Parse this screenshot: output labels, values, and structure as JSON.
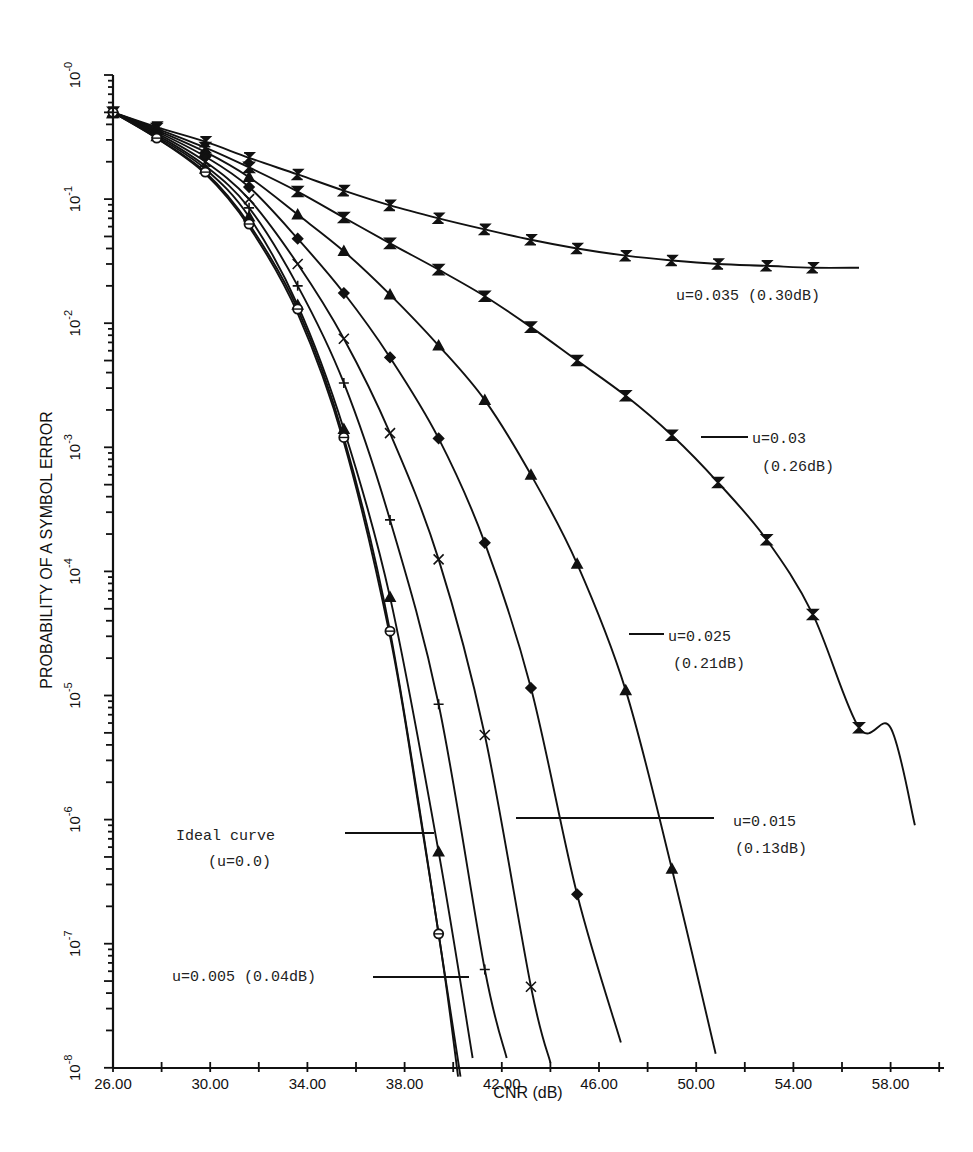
{
  "chart_data": {
    "type": "line",
    "title": "",
    "xlabel": "CNR (dB)",
    "ylabel": "PROBABILITY OF A SYMBOL ERROR",
    "xscale": "linear",
    "yscale": "log",
    "xlim": [
      26,
      60.2
    ],
    "ylim": [
      1e-08,
      1
    ],
    "grid": false,
    "legend_position": "inline annotations",
    "x_ticks": [
      "26.00",
      "30.00",
      "34.00",
      "38.00",
      "42.00",
      "46.00",
      "50.00",
      "54.00",
      "58.00"
    ],
    "x_tick_values": [
      26,
      30,
      34,
      38,
      42,
      46,
      50,
      54,
      58
    ],
    "y_ticks": [
      {
        "base": "10",
        "exp": "-0",
        "value": 1
      },
      {
        "base": "10",
        "exp": "-1",
        "value": 0.1
      },
      {
        "base": "10",
        "exp": "-2",
        "value": 0.01
      },
      {
        "base": "10",
        "exp": "-3",
        "value": 0.001
      },
      {
        "base": "10",
        "exp": "-4",
        "value": 0.0001
      },
      {
        "base": "10",
        "exp": "-5",
        "value": 1e-05
      },
      {
        "base": "10",
        "exp": "-6",
        "value": 1e-06
      },
      {
        "base": "10",
        "exp": "-7",
        "value": 1e-07
      },
      {
        "base": "10",
        "exp": "-8",
        "value": 1e-08
      }
    ],
    "series": [
      {
        "name": "u=0.035 (0.30dB)",
        "marker": "Z",
        "x": [
          26.0,
          27.8,
          29.8,
          31.6,
          33.6,
          35.5,
          37.4,
          39.4,
          41.3,
          43.2,
          45.1,
          47.1,
          49.0,
          50.9,
          52.9,
          54.8,
          56.7
        ],
        "y": [
          0.5,
          0.38,
          0.29,
          0.215,
          0.158,
          0.117,
          0.089,
          0.07,
          0.057,
          0.047,
          0.04,
          0.035,
          0.032,
          0.03,
          0.029,
          0.028,
          0.028
        ],
        "markers_at": [
          0,
          1,
          2,
          3,
          4,
          5,
          6,
          7,
          8,
          9,
          10,
          11,
          12,
          13,
          14,
          15
        ]
      },
      {
        "name": "u=0.03 (0.26dB)",
        "marker": "bowtie",
        "x": [
          26.0,
          27.8,
          29.8,
          31.6,
          33.6,
          35.5,
          37.4,
          39.4,
          41.3,
          43.2,
          45.1,
          47.1,
          49.0,
          50.9,
          52.9,
          54.8,
          56.7,
          58.0,
          59.0
        ],
        "y": [
          0.5,
          0.37,
          0.26,
          0.18,
          0.115,
          0.071,
          0.044,
          0.027,
          0.0165,
          0.0093,
          0.005,
          0.0026,
          0.00125,
          0.00052,
          0.00018,
          4.5e-05,
          5.5e-06,
          5.5e-06,
          9e-07
        ],
        "markers_at": [
          0,
          1,
          2,
          3,
          4,
          5,
          6,
          7,
          8,
          9,
          10,
          11,
          12,
          13,
          14,
          15,
          16
        ]
      },
      {
        "name": "u=0.025 (0.21dB)",
        "marker": "triangle",
        "x": [
          26.0,
          27.8,
          29.8,
          31.6,
          33.6,
          35.5,
          37.4,
          39.4,
          41.3,
          43.2,
          45.1,
          47.1,
          49.0,
          50.8
        ],
        "y": [
          0.5,
          0.36,
          0.24,
          0.15,
          0.075,
          0.038,
          0.017,
          0.0066,
          0.0024,
          0.0006,
          0.000115,
          1.1e-05,
          4e-07,
          1.3e-08
        ],
        "markers_at": [
          0,
          1,
          2,
          3,
          4,
          5,
          6,
          7,
          8,
          9,
          10,
          11,
          12
        ]
      },
      {
        "name": "u=0.02",
        "marker": "diamond",
        "x": [
          26.0,
          27.8,
          29.8,
          31.6,
          33.6,
          35.5,
          37.4,
          39.4,
          41.3,
          43.2,
          45.1,
          46.9
        ],
        "y": [
          0.5,
          0.35,
          0.22,
          0.125,
          0.048,
          0.0175,
          0.0053,
          0.00118,
          0.00017,
          1.15e-05,
          2.5e-07,
          1.6e-08
        ],
        "markers_at": [
          0,
          1,
          2,
          3,
          4,
          5,
          6,
          7,
          8,
          9,
          10
        ]
      },
      {
        "name": "u=0.015 (0.13dB)",
        "marker": "x",
        "x": [
          26.0,
          27.8,
          29.8,
          31.6,
          33.6,
          35.5,
          37.4,
          39.4,
          41.3,
          43.2,
          44.0
        ],
        "y": [
          0.5,
          0.34,
          0.2,
          0.1,
          0.03,
          0.0075,
          0.0013,
          0.000125,
          4.8e-06,
          4.5e-08,
          1.1e-08
        ],
        "markers_at": [
          0,
          1,
          2,
          3,
          4,
          5,
          6,
          7,
          8,
          9
        ]
      },
      {
        "name": "u=0.01",
        "marker": "plus",
        "x": [
          26.0,
          27.8,
          29.8,
          31.6,
          33.6,
          35.5,
          37.4,
          39.4,
          41.3,
          42.2
        ],
        "y": [
          0.5,
          0.33,
          0.185,
          0.085,
          0.02,
          0.0033,
          0.00026,
          8.5e-06,
          6.2e-08,
          1.2e-08
        ],
        "markers_at": [
          0,
          1,
          2,
          3,
          4,
          5,
          6,
          7,
          8
        ]
      },
      {
        "name": "u=0.005 (0.04dB)",
        "marker": "triangle-up",
        "x": [
          26.0,
          27.8,
          29.8,
          31.6,
          33.6,
          35.5,
          37.4,
          39.4,
          40.8
        ],
        "y": [
          0.5,
          0.32,
          0.175,
          0.072,
          0.014,
          0.0014,
          6.2e-05,
          5.5e-07,
          1.2e-08
        ],
        "markers_at": [
          0,
          1,
          2,
          3,
          4,
          5,
          6,
          7
        ]
      },
      {
        "name": "u=0.0025",
        "marker": "circle",
        "x": [
          26.0,
          27.8,
          29.8,
          31.6,
          33.6,
          35.5,
          37.4,
          39.4,
          40.2
        ],
        "y": [
          0.5,
          0.31,
          0.165,
          0.063,
          0.013,
          0.0012,
          3.3e-05,
          1.2e-07,
          8.5e-09
        ],
        "markers_at": [
          0,
          1,
          2,
          3,
          4,
          5,
          6,
          7
        ]
      },
      {
        "name": "Ideal curve (u=0.0)",
        "marker": "none",
        "x": [
          26.0,
          27.8,
          29.8,
          31.6,
          33.6,
          35.5,
          37.4,
          38.6,
          39.4,
          40.3
        ],
        "y": [
          0.5,
          0.31,
          0.16,
          0.06,
          0.012,
          0.0011,
          3e-05,
          1.2e-06,
          1.2e-07,
          8.5e-09
        ],
        "markers_at": []
      }
    ],
    "annotations": [
      {
        "id": "u035",
        "lines": [
          "u=0.035 (0.30dB)"
        ],
        "x": 676,
        "y": 300,
        "leader": null
      },
      {
        "id": "u03",
        "lines": [
          "u=0.03",
          "(0.26dB)"
        ],
        "x": 752,
        "y": 443,
        "line2x": 762,
        "line2y": 471,
        "leader": [
          701,
          437,
          748,
          437
        ]
      },
      {
        "id": "u025",
        "lines": [
          "u=0.025",
          "(0.21dB)"
        ],
        "x": 668,
        "y": 641,
        "line2x": 673,
        "line2y": 668,
        "leader": [
          629,
          634,
          664,
          634
        ]
      },
      {
        "id": "u015",
        "lines": [
          "u=0.015",
          "(0.13dB)"
        ],
        "x": 733,
        "y": 826,
        "line2x": 735,
        "line2y": 853,
        "leader": [
          516,
          818,
          714,
          818
        ]
      },
      {
        "id": "ideal",
        "lines": [
          "Ideal curve",
          "(u=0.0)"
        ],
        "x": 176,
        "y": 840,
        "line2x": 208,
        "line2y": 866,
        "leader": [
          345,
          833,
          434,
          833
        ]
      },
      {
        "id": "u005",
        "lines": [
          "u=0.005 (0.04dB)"
        ],
        "x": 172,
        "y": 981,
        "leader": [
          373,
          977,
          469,
          977
        ]
      }
    ]
  }
}
